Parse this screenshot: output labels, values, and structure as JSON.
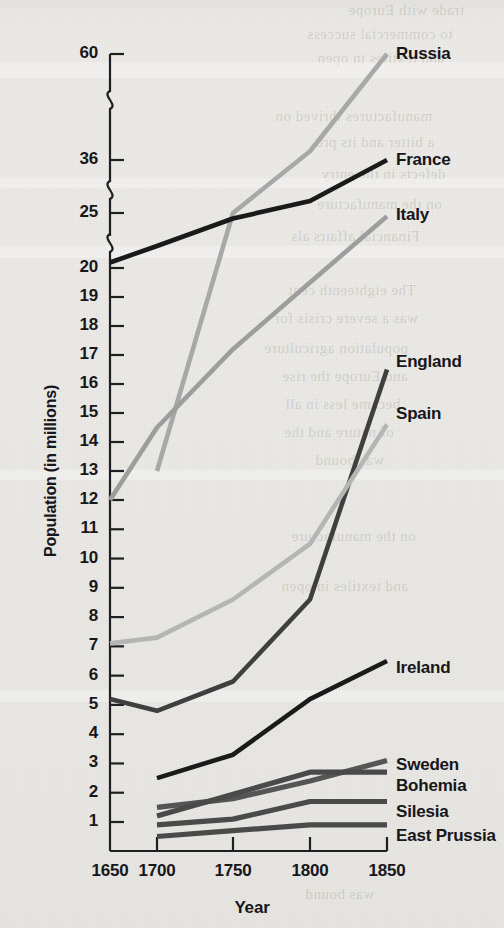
{
  "chart_data": {
    "type": "line",
    "title": "",
    "xlabel": "Year",
    "ylabel": "Population (in millions)",
    "x": [
      1650,
      1700,
      1750,
      1800,
      1850
    ],
    "xtick_labels": [
      "1650",
      "1700",
      "1750",
      "1800",
      "1850"
    ],
    "ytick_labels": [
      "60",
      "36",
      "25",
      "20",
      "19",
      "18",
      "17",
      "16",
      "15",
      "14",
      "13",
      "12",
      "11",
      "10",
      "9",
      "8",
      "7",
      "6",
      "5",
      "4",
      "3",
      "2",
      "1"
    ],
    "y_axis_broken": true,
    "y_break_positions": [
      "between 20 and 25",
      "between 25 and 36",
      "between 36 and 60"
    ],
    "ylim": [
      0,
      60
    ],
    "grid": false,
    "legend_position": "right-inline-labels",
    "series": [
      {
        "name": "Russia",
        "color": "#a8a8a8",
        "x": [
          1700,
          1750,
          1800,
          1850
        ],
        "values": [
          13.0,
          25.0,
          38.0,
          60.0
        ]
      },
      {
        "name": "France",
        "color": "#1a1a1a",
        "x": [
          1650,
          1700,
          1750,
          1800,
          1850
        ],
        "values": [
          20.5,
          22.0,
          24.5,
          27.5,
          36.0
        ]
      },
      {
        "name": "Italy",
        "color": "#9d9d9d",
        "x": [
          1650,
          1700,
          1750,
          1800,
          1850
        ],
        "values": [
          12.0,
          14.5,
          17.2,
          19.5,
          24.7
        ]
      },
      {
        "name": "England",
        "color": "#3f3f3f",
        "x": [
          1650,
          1700,
          1750,
          1800,
          1850
        ],
        "values": [
          5.2,
          4.8,
          5.8,
          8.6,
          16.5
        ]
      },
      {
        "name": "Spain",
        "color": "#b5b5b5",
        "x": [
          1650,
          1700,
          1750,
          1800,
          1850
        ],
        "values": [
          7.1,
          7.3,
          8.6,
          10.5,
          14.6
        ]
      },
      {
        "name": "Ireland",
        "color": "#1a1a1a",
        "x": [
          1700,
          1750,
          1800,
          1850
        ],
        "values": [
          2.5,
          3.3,
          5.2,
          6.5
        ]
      },
      {
        "name": "Sweden",
        "color": "#555555",
        "x": [
          1700,
          1750,
          1800,
          1850
        ],
        "values": [
          1.5,
          1.8,
          2.4,
          3.1
        ]
      },
      {
        "name": "Bohemia",
        "color": "#4a4a4a",
        "x": [
          1700,
          1800,
          1850
        ],
        "values": [
          1.2,
          2.7,
          2.7
        ]
      },
      {
        "name": "Silesia",
        "color": "#4a4a4a",
        "x": [
          1700,
          1750,
          1800,
          1850
        ],
        "values": [
          0.9,
          1.1,
          1.7,
          1.7
        ]
      },
      {
        "name": "East Prussia",
        "color": "#4a4a4a",
        "x": [
          1700,
          1750,
          1800,
          1850
        ],
        "values": [
          0.5,
          0.7,
          0.9,
          0.9
        ]
      }
    ],
    "series_label_text": [
      "Russia",
      "France",
      "Italy",
      "England",
      "Spain",
      "Ireland",
      "Sweden",
      "Bohemia",
      "Silesia",
      "East Prussia"
    ]
  },
  "axis": {
    "y_title": "Population (in millions)",
    "x_title": "Year"
  },
  "bleed_text": {
    "l1": "trade with Europe",
    "l2": "to commercial success",
    "l3": "and textiles in open",
    "l4": "manufactures thrived on",
    "l5": "a bitter and its pro",
    "l6": "defects in the entry",
    "l7": "on the manufacture",
    "l8": "Financial affairs als",
    "l9": "The eighteenth cent",
    "l10": "was a severe crisis for",
    "l11": "population agriculture",
    "l12": "and Europe the rise",
    "l13": "became less in all",
    "l14": "of nature and the",
    "l15": "was bound"
  }
}
